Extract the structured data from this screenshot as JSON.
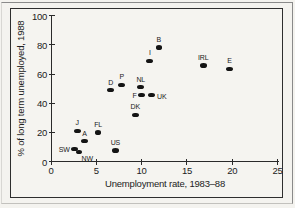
{
  "figure": {
    "background_color": "#f4f3ef",
    "border_color": "#2e2e2e",
    "dot_color": "#141414",
    "text_color": "#1d1d1d"
  },
  "chart_data": {
    "type": "scatter",
    "title": "",
    "xlabel": "Unemployment rate, 1983–88",
    "ylabel": "% of long term unemployed, 1988",
    "xlim": [
      0,
      25
    ],
    "ylim": [
      0,
      100
    ],
    "x_ticks": [
      "0",
      "5",
      "10",
      "15",
      "20",
      "25"
    ],
    "y_ticks": [
      "0",
      "20",
      "40",
      "60",
      "80",
      "100"
    ],
    "grid": false,
    "legend": "none",
    "marker": "filled-black-ellipse",
    "points": [
      {
        "label": "SW",
        "x": 2.6,
        "y": 8.5,
        "label_pos": "left"
      },
      {
        "label": "NW",
        "x": 3.1,
        "y": 6.5,
        "label_pos": "below-right"
      },
      {
        "label": "A",
        "x": 3.7,
        "y": 14,
        "label_pos": "above"
      },
      {
        "label": "J",
        "x": 2.9,
        "y": 21,
        "label_pos": "above"
      },
      {
        "label": "FL",
        "x": 5.2,
        "y": 20,
        "label_pos": "above"
      },
      {
        "label": "US",
        "x": 7.1,
        "y": 7.5,
        "label_pos": "above"
      },
      {
        "label": "D",
        "x": 6.6,
        "y": 49,
        "label_pos": "above"
      },
      {
        "label": "P",
        "x": 7.8,
        "y": 52.5,
        "label_pos": "above"
      },
      {
        "label": "NL",
        "x": 9.9,
        "y": 51,
        "label_pos": "above"
      },
      {
        "label": "F",
        "x": 10.0,
        "y": 45.5,
        "label_pos": "left"
      },
      {
        "label": "UK",
        "x": 11.1,
        "y": 45.5,
        "label_pos": "right"
      },
      {
        "label": "DK",
        "x": 9.3,
        "y": 32,
        "label_pos": "above"
      },
      {
        "label": "I",
        "x": 10.9,
        "y": 69,
        "label_pos": "above"
      },
      {
        "label": "B",
        "x": 11.9,
        "y": 78,
        "label_pos": "above"
      },
      {
        "label": "IRL",
        "x": 16.8,
        "y": 66,
        "label_pos": "above"
      },
      {
        "label": "E",
        "x": 19.7,
        "y": 63.5,
        "label_pos": "above"
      }
    ]
  }
}
